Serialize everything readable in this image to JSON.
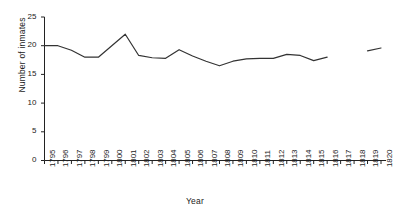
{
  "chart_data": {
    "type": "line",
    "title": "",
    "xlabel": "Year",
    "ylabel": "Number of inmates",
    "xlim": [
      1795,
      1820
    ],
    "ylim": [
      0,
      25
    ],
    "yticks": [
      0,
      5,
      10,
      15,
      20,
      25
    ],
    "xticks": [
      1795,
      1796,
      1797,
      1798,
      1799,
      1800,
      1801,
      1802,
      1803,
      1804,
      1805,
      1806,
      1807,
      1808,
      1809,
      1810,
      1811,
      1812,
      1813,
      1814,
      1815,
      1816,
      1817,
      1818,
      1819,
      1820
    ],
    "grid": false,
    "legend": false,
    "line_color": "#333333",
    "series": [
      {
        "name": "Number of inmates",
        "x": [
          1795,
          1796,
          1797,
          1798,
          1799,
          1800,
          1801,
          1802,
          1803,
          1804,
          1805,
          1806,
          1807,
          1808,
          1809,
          1810,
          1811,
          1812,
          1813,
          1814,
          1815,
          1816
        ],
        "values": [
          20.0,
          20.0,
          19.2,
          18.0,
          18.0,
          20.0,
          22.0,
          18.3,
          17.9,
          17.8,
          19.3,
          18.2,
          17.3,
          16.5,
          17.3,
          17.7,
          17.8,
          17.8,
          18.5,
          18.3,
          17.4,
          18.0
        ]
      },
      {
        "name": "Number of inmates (resumed)",
        "x": [
          1819,
          1820
        ],
        "values": [
          19.1,
          19.6
        ]
      }
    ]
  },
  "axis": {
    "y_tick_labels": [
      "0",
      "5",
      "10",
      "15",
      "20",
      "25"
    ],
    "x_tick_labels": [
      "1795",
      "1796",
      "1797",
      "1798",
      "1799",
      "1800",
      "1801",
      "1802",
      "1803",
      "1804",
      "1805",
      "1806",
      "1807",
      "1808",
      "1809",
      "1810",
      "1811",
      "1812",
      "1813",
      "1814",
      "1815",
      "1816",
      "1817",
      "1818",
      "1819",
      "1820"
    ],
    "y_title": "Number of inmates",
    "x_title": "Year"
  }
}
